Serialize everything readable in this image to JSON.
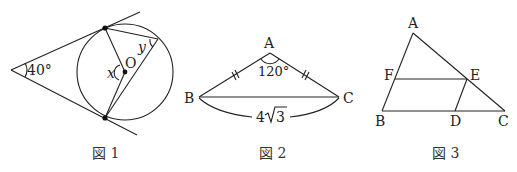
{
  "figures": [
    {
      "caption": "図 1",
      "angle_label": "40°",
      "var_x": "x",
      "var_y": "y",
      "center_label": "O"
    },
    {
      "caption": "図 2",
      "vertices": {
        "A": "A",
        "B": "B",
        "C": "C"
      },
      "angle_label": "120°",
      "length_coeff": "4",
      "length_radicand": "3"
    },
    {
      "caption": "図 3",
      "vertices": {
        "A": "A",
        "B": "B",
        "C": "C",
        "D": "D",
        "E": "E",
        "F": "F"
      }
    }
  ]
}
